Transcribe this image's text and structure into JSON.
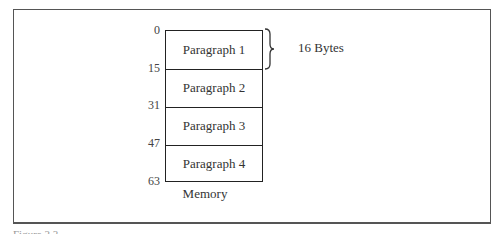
{
  "figure": {
    "memory_label": "Memory",
    "size_annotation": "16 Bytes",
    "paragraphs": [
      "Paragraph 1",
      "Paragraph 2",
      "Paragraph 3",
      "Paragraph 4"
    ],
    "addresses": [
      "0",
      "15",
      "31",
      "47",
      "63"
    ],
    "caption": "Figure 2.3"
  }
}
